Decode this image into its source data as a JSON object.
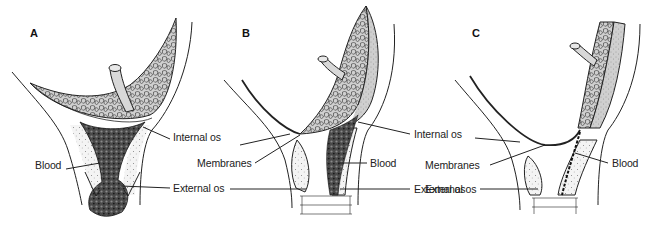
{
  "figure": {
    "panels": [
      {
        "id": "A",
        "letter": "A",
        "x": 30,
        "y": 27
      },
      {
        "id": "B",
        "letter": "B",
        "x": 242,
        "y": 27
      },
      {
        "id": "C",
        "letter": "C",
        "x": 472,
        "y": 27
      }
    ],
    "labels": [
      {
        "panel": "A",
        "text": "Internal os",
        "x": 173,
        "y": 137
      },
      {
        "panel": "A",
        "text": "Blood",
        "x": 35,
        "y": 165
      },
      {
        "panel": "A",
        "text": "External os",
        "x": 173,
        "y": 184
      },
      {
        "panel": "B",
        "text": "Membranes",
        "x": 197,
        "y": 157
      },
      {
        "panel": "B",
        "text": "Internal os",
        "x": 414,
        "y": 130
      },
      {
        "panel": "B",
        "text": "Blood",
        "x": 370,
        "y": 158
      },
      {
        "panel": "B",
        "text": "External os",
        "x": 414,
        "y": 184
      },
      {
        "panel": "C",
        "text": "Membranes",
        "x": 425,
        "y": 159
      },
      {
        "panel": "C",
        "text": "External os",
        "x": 425,
        "y": 184
      },
      {
        "panel": "C",
        "text": "Blood",
        "x": 612,
        "y": 158
      }
    ],
    "colors": {
      "line": "#222222",
      "placenta_fill": "#cfcfcf",
      "uterine_fill": "#dedede",
      "blood_fill": "#3a3a3a",
      "background": "#ffffff"
    }
  }
}
